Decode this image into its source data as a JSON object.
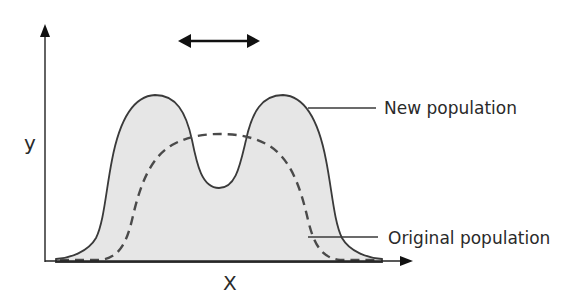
{
  "diagram": {
    "axes": {
      "x_label": "X",
      "y_label": "y"
    },
    "labels": {
      "new_population": "New population",
      "original_population": "Original population"
    },
    "shift_arrow": {
      "direction": "bidirectional-horizontal"
    },
    "colors": {
      "stroke": "#3a3a3a",
      "fill": "#e6e6e6",
      "axis": "#222222",
      "text": "#2a2a2a"
    },
    "series": [
      {
        "name": "New population",
        "style": "solid-filled",
        "shape": "bimodal"
      },
      {
        "name": "Original population",
        "style": "dashed",
        "shape": "unimodal"
      }
    ]
  }
}
